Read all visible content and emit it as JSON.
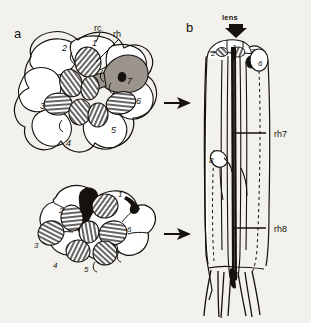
{
  "figure": {
    "background_color": "#f3f1ec",
    "ink_color": "#15110e",
    "shade_color": "#9a948d",
    "panels": [
      {
        "id": "a",
        "letter": "a",
        "description": "cross sections of ommatidium retinula cells",
        "annotations": [
          {
            "name": "rc",
            "text": "rc",
            "meaning": "retinula cell"
          },
          {
            "name": "rh",
            "text": "rh",
            "meaning": "rhabdomere"
          }
        ],
        "top_section": {
          "cell_numbers": [
            "1",
            "2",
            "3",
            "4",
            "5",
            "6",
            "7"
          ]
        },
        "bottom_section": {
          "cell_numbers": [
            "1",
            "2",
            "3",
            "4",
            "5",
            "6"
          ]
        }
      },
      {
        "id": "b",
        "letter": "b",
        "description": "longitudinal section of ommatidium",
        "lens_label": "lens",
        "cell_numbers": [
          "1",
          "2",
          "6",
          "7",
          "8"
        ],
        "rhabdomere_labels": [
          "rh7",
          "rh8"
        ]
      }
    ],
    "arrows": [
      {
        "name": "arrow-top",
        "direction": "right"
      },
      {
        "name": "arrow-bottom",
        "direction": "right"
      },
      {
        "name": "lens-arrow",
        "direction": "down"
      }
    ]
  }
}
